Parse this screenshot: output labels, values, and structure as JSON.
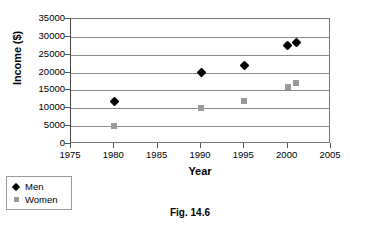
{
  "caption": "Fig. 14.6",
  "legend": {
    "position": "below-left",
    "entries": [
      {
        "label": "Men",
        "marker": "diamond-marker",
        "color": "#000000"
      },
      {
        "label": "Women",
        "marker": "square-marker",
        "color": "#9a9a9a"
      }
    ]
  },
  "chart_data": {
    "type": "scatter",
    "title": "",
    "xlabel": "Year",
    "ylabel": "Income ($)",
    "xlim": [
      1975,
      2005
    ],
    "ylim": [
      0,
      35000
    ],
    "xticks": [
      1975,
      1980,
      1985,
      1990,
      1995,
      2000,
      2005
    ],
    "xtick_labels": [
      "1975",
      "1980",
      "1985",
      "1990",
      "1995",
      "2000",
      "2005"
    ],
    "yticks": [
      0,
      5000,
      10000,
      15000,
      20000,
      25000,
      30000,
      35000
    ],
    "ytick_labels": [
      "0",
      "5000",
      "10000",
      "15000",
      "20000",
      "25000",
      "30000",
      "35000"
    ],
    "grid": "horizontal",
    "grid_color": "#8c8c8c",
    "series": [
      {
        "name": "Men",
        "marker": "diamond",
        "color": "#000000",
        "x": [
          1980,
          1990,
          1995,
          2000,
          2001
        ],
        "values": [
          12000,
          20000,
          22000,
          27500,
          28500
        ]
      },
      {
        "name": "Women",
        "marker": "square",
        "color": "#9a9a9a",
        "x": [
          1980,
          1990,
          1995,
          2000,
          2001
        ],
        "values": [
          5000,
          10000,
          12000,
          16000,
          17000
        ]
      }
    ]
  }
}
